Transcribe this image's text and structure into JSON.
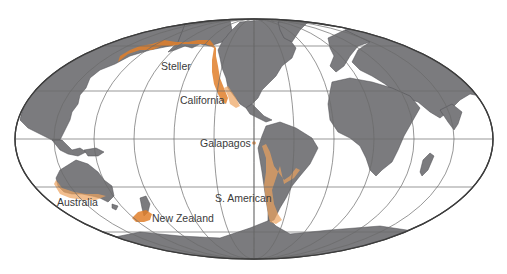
{
  "map": {
    "projection": "Mollweide (world)",
    "background_color": "#ffffff",
    "land_color": "#7b7b7e",
    "range_color": "#e07f2a",
    "grid_color": "#6a6a6a",
    "labels": {
      "steller": "Steller",
      "california": "California",
      "galapagos": "Galapagos",
      "s_american": "S. American",
      "australia": "Australia",
      "new_zealand": "New Zealand"
    },
    "regions": [
      {
        "name": "Steller",
        "area": "North Pacific rim (Japan to Alaska to N. California)"
      },
      {
        "name": "California",
        "area": "West coast of North America"
      },
      {
        "name": "Galapagos",
        "area": "Galapagos Islands"
      },
      {
        "name": "S. American",
        "area": "South American coasts"
      },
      {
        "name": "Australia",
        "area": "Southern/western Australian coast"
      },
      {
        "name": "New Zealand",
        "area": "Southern New Zealand and subantarctic islands"
      }
    ]
  }
}
